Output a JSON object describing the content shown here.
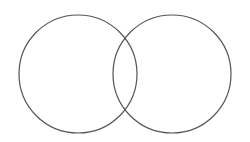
{
  "diagram": {
    "type": "venn",
    "background": "#ffffff",
    "stroke_color": "#555555",
    "stroke_width": 1.2,
    "circles": [
      {
        "id": "left",
        "cx": 78,
        "cy": 74,
        "r": 59
      },
      {
        "id": "right",
        "cx": 172,
        "cy": 74,
        "r": 59
      }
    ]
  }
}
